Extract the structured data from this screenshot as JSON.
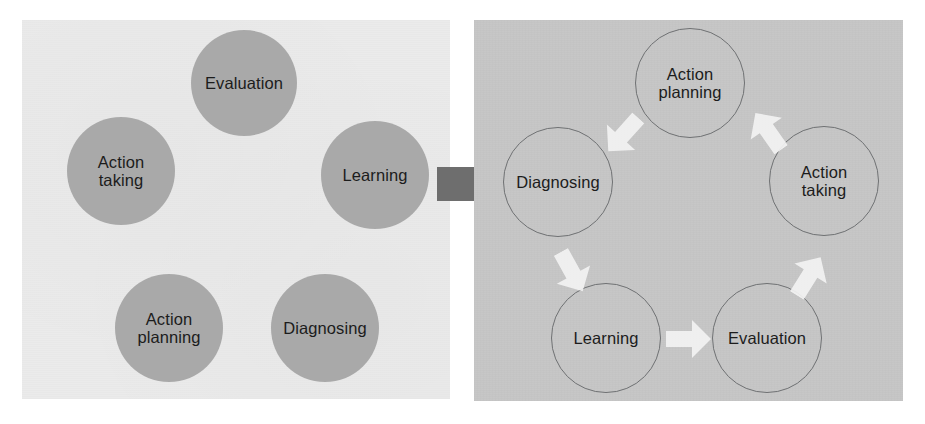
{
  "diagram": {
    "colors": {
      "panel_before_bg": "#ebebeb",
      "panel_after_bg": "#c6c6c6",
      "node_fill": "#a9a9a9",
      "node_outline": "#6f7173",
      "label_text": "#1c1c1c",
      "transform_arrow": "#6e6e6e",
      "cycle_arrow": "#f2f2f2"
    }
  },
  "panel_before": {
    "name": "unordered-concepts-panel",
    "nodes": [
      {
        "id": "evaluation",
        "label": "Evaluation",
        "cx": 244,
        "cy": 83,
        "r": 53
      },
      {
        "id": "action-taking",
        "label": "Action\ntaking",
        "cx": 121,
        "cy": 171,
        "r": 54
      },
      {
        "id": "learning",
        "label": "Learning",
        "cx": 375,
        "cy": 175,
        "r": 54
      },
      {
        "id": "action-planning",
        "label": "Action\nplanning",
        "cx": 169,
        "cy": 328,
        "r": 54
      },
      {
        "id": "diagnosing",
        "label": "Diagnosing",
        "cx": 325,
        "cy": 328,
        "r": 54
      }
    ]
  },
  "transform": {
    "name": "transform-arrow",
    "direction": "right"
  },
  "panel_after": {
    "name": "action-research-cycle-panel",
    "nodes": [
      {
        "id": "action-planning",
        "label": "Action\nplanning",
        "cx": 690,
        "cy": 83,
        "r": 55
      },
      {
        "id": "action-taking",
        "label": "Action\ntaking",
        "cx": 824,
        "cy": 181,
        "r": 55
      },
      {
        "id": "evaluation",
        "label": "Evaluation",
        "cx": 767,
        "cy": 338,
        "r": 55
      },
      {
        "id": "learning",
        "label": "Learning",
        "cx": 606,
        "cy": 338,
        "r": 55
      },
      {
        "id": "diagnosing",
        "label": "Diagnosing",
        "cx": 558,
        "cy": 182,
        "r": 55
      }
    ],
    "arrows": [
      {
        "id": "arrow-diagnosing-to-action-planning",
        "from": "diagnosing",
        "to": "action-planning",
        "cx": 623,
        "cy": 135,
        "rotate": -48
      },
      {
        "id": "arrow-action-planning-to-action-taking",
        "from": "action-planning",
        "to": "action-taking",
        "cx": 768,
        "cy": 131,
        "rotate": 55
      },
      {
        "id": "arrow-action-taking-to-evaluation",
        "from": "action-taking",
        "to": "evaluation",
        "cx": 809,
        "cy": 276,
        "rotate": 122
      },
      {
        "id": "arrow-evaluation-to-learning",
        "from": "evaluation",
        "to": "learning",
        "cx": 689,
        "cy": 339,
        "rotate": 180
      },
      {
        "id": "arrow-learning-to-diagnosing",
        "from": "learning",
        "to": "diagnosing",
        "cx": 572,
        "cy": 272,
        "rotate": -119
      }
    ]
  },
  "chart_data": {
    "type": "diagram",
    "stages": [
      "Diagnosing",
      "Action planning",
      "Action taking",
      "Evaluation",
      "Learning"
    ],
    "flow": "cyclic",
    "order": [
      "Diagnosing -> Action planning",
      "Action planning -> Action taking",
      "Action taking -> Evaluation",
      "Evaluation -> Learning",
      "Learning -> Diagnosing"
    ]
  }
}
